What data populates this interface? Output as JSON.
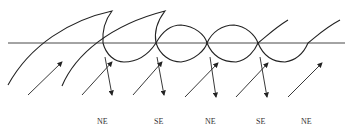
{
  "diagram": {
    "labels": [
      {
        "text": "NE",
        "x": 101,
        "y": 124
      },
      {
        "text": "SE",
        "x": 158,
        "y": 124
      },
      {
        "text": "NE",
        "x": 210,
        "y": 124
      },
      {
        "text": "SE",
        "x": 260,
        "y": 124
      },
      {
        "text": "NE",
        "x": 306,
        "y": 124
      }
    ],
    "colors": {
      "stroke": "#222222",
      "background": "#ffffff"
    }
  }
}
